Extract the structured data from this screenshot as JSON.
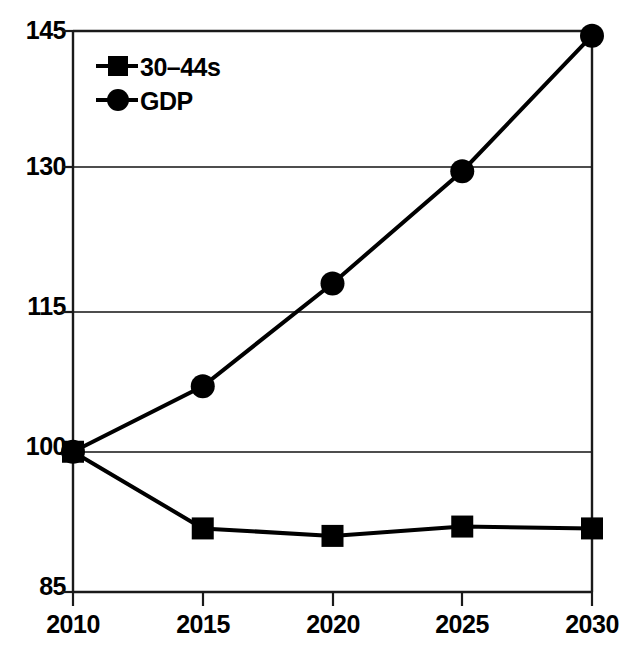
{
  "chart_data": {
    "type": "line",
    "title": "",
    "subtitle": "",
    "xlabel": "",
    "ylabel": "",
    "categories": [
      "2010",
      "2015",
      "2020",
      "2025",
      "2030"
    ],
    "x": [
      2010,
      2015,
      2020,
      2025,
      2030
    ],
    "xlim": [
      2010,
      2030
    ],
    "ylim": [
      85,
      145
    ],
    "yticks": [
      85,
      100,
      115,
      130,
      145
    ],
    "xticks": [
      2010,
      2015,
      2020,
      2025,
      2030
    ],
    "grid": "horizontal",
    "legend_position": "top-left-inside",
    "series": [
      {
        "name": "30–44s",
        "marker": "square",
        "color": "#000000",
        "values": [
          100,
          91.8,
          91.0,
          92.0,
          91.8
        ]
      },
      {
        "name": "GDP",
        "marker": "circle",
        "color": "#000000",
        "values": [
          100,
          107.0,
          118.0,
          130.0,
          144.5
        ]
      }
    ],
    "annotations": []
  },
  "axes": {
    "y_tick_labels": [
      "145",
      "130",
      "115",
      "100",
      "85"
    ],
    "x_tick_labels": [
      "2010",
      "2015",
      "2020",
      "2025",
      "2030"
    ]
  },
  "legend": {
    "items": [
      {
        "label": "30–44s",
        "marker": "square"
      },
      {
        "label": "GDP",
        "marker": "circle"
      }
    ]
  },
  "colors": {
    "ink": "#000000",
    "frame": "#1a1a1a",
    "gridline": "#4d4d4d",
    "background": "#ffffff"
  }
}
